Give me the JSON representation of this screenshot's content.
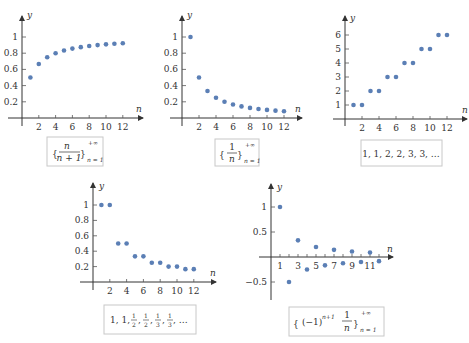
{
  "chart_data": [
    {
      "id": "plot1",
      "type": "scatter",
      "title": "",
      "xlabel": "n",
      "ylabel": "y",
      "caption": "{ n/(n+1) } n=1 to +∞",
      "x": [
        1,
        2,
        3,
        4,
        5,
        6,
        7,
        8,
        9,
        10,
        11,
        12
      ],
      "values": [
        0.5,
        0.667,
        0.75,
        0.8,
        0.833,
        0.857,
        0.875,
        0.889,
        0.9,
        0.909,
        0.917,
        0.923
      ],
      "xticks": [
        "2",
        "4",
        "6",
        "8",
        "10",
        "12"
      ],
      "yticks": [
        "0.2",
        "0.4",
        "0.6",
        "0.8",
        "1"
      ],
      "xlim": [
        0,
        14
      ],
      "ylim": [
        0,
        1.2
      ],
      "grid": false,
      "legend": false
    },
    {
      "id": "plot2",
      "type": "scatter",
      "title": "",
      "xlabel": "n",
      "ylabel": "y",
      "caption": "{ 1/n } n=1 to +∞",
      "x": [
        1,
        2,
        3,
        4,
        5,
        6,
        7,
        8,
        9,
        10,
        11,
        12
      ],
      "values": [
        1,
        0.5,
        0.333,
        0.25,
        0.2,
        0.167,
        0.143,
        0.125,
        0.111,
        0.1,
        0.091,
        0.083
      ],
      "xticks": [
        "2",
        "4",
        "6",
        "8",
        "10",
        "12"
      ],
      "yticks": [
        "0.2",
        "0.4",
        "0.6",
        "0.8",
        "1"
      ],
      "xlim": [
        0,
        14
      ],
      "ylim": [
        0,
        1.2
      ],
      "grid": false,
      "legend": false
    },
    {
      "id": "plot3",
      "type": "scatter",
      "title": "",
      "xlabel": "n",
      "ylabel": "y",
      "caption": "1, 1, 2, 2, 3, 3, ...",
      "x": [
        1,
        2,
        3,
        4,
        5,
        6,
        7,
        8,
        9,
        10,
        11,
        12
      ],
      "values": [
        1,
        1,
        2,
        2,
        3,
        3,
        4,
        4,
        5,
        5,
        6,
        6
      ],
      "xticks": [
        "2",
        "4",
        "6",
        "8",
        "10",
        "12"
      ],
      "yticks": [
        "1",
        "2",
        "3",
        "4",
        "5",
        "6"
      ],
      "xlim": [
        0,
        14
      ],
      "ylim": [
        0,
        7
      ],
      "grid": false,
      "legend": false
    },
    {
      "id": "plot4",
      "type": "scatter",
      "title": "",
      "xlabel": "n",
      "ylabel": "y",
      "caption": "1, 1, 1/2, 1/2, 1/3, 1/3, ...",
      "x": [
        1,
        2,
        3,
        4,
        5,
        6,
        7,
        8,
        9,
        10,
        11,
        12
      ],
      "values": [
        1,
        1,
        0.5,
        0.5,
        0.333,
        0.333,
        0.25,
        0.25,
        0.2,
        0.2,
        0.167,
        0.167
      ],
      "xticks": [
        "2",
        "4",
        "6",
        "8",
        "10",
        "12"
      ],
      "yticks": [
        "0.2",
        "0.4",
        "0.6",
        "0.8",
        "1"
      ],
      "xlim": [
        0,
        14
      ],
      "ylim": [
        0,
        1.2
      ],
      "grid": false,
      "legend": false
    },
    {
      "id": "plot5",
      "type": "scatter",
      "title": "",
      "xlabel": "n",
      "ylabel": "y",
      "caption": "{ (-1)^(n+1) 1/n } n=1 to +∞",
      "x": [
        1,
        2,
        3,
        4,
        5,
        6,
        7,
        8,
        9,
        10,
        11,
        12
      ],
      "values": [
        1,
        -0.5,
        0.333,
        -0.25,
        0.2,
        -0.167,
        0.143,
        -0.125,
        0.111,
        -0.1,
        0.091,
        -0.083
      ],
      "xticks": [
        "1",
        "3",
        "5",
        "7",
        "9",
        "11"
      ],
      "yticks": [
        "-0.5",
        "0.5",
        "1"
      ],
      "xlim": [
        0,
        14
      ],
      "ylim": [
        -0.8,
        1.3
      ],
      "grid": false,
      "legend": false
    }
  ],
  "labels": {
    "y": "y",
    "n": "n",
    "p1_yticks": [
      "1",
      "0.8",
      "0.6",
      "0.4",
      "0.2"
    ],
    "p1_xticks": [
      "2",
      "4",
      "6",
      "8",
      "10",
      "12"
    ],
    "p3_yticks": [
      "6",
      "5",
      "4",
      "3",
      "2",
      "1"
    ],
    "p5_yticks": [
      "1",
      "0.5",
      "−0.5"
    ],
    "p5_xticks": [
      "1",
      "3",
      "5",
      "7",
      "9",
      "11"
    ],
    "cap1": {
      "num": "n",
      "den": "n + 1",
      "sup": "+∞",
      "sub": "n = 1"
    },
    "cap2": {
      "num": "1",
      "den": "n",
      "sup": "+∞",
      "sub": "n = 1"
    },
    "cap3": "1, 1, 2, 2, 3, 3, …",
    "cap4": {
      "a": "1, 1, ",
      "h1": "1",
      "d1": "2",
      "h2": "1",
      "d2": "2",
      "t1": "1",
      "dt1": "3",
      "t2": "1",
      "dt2": "3",
      "tail": ", …"
    },
    "cap5": {
      "base": "(−1)",
      "exp": "n+1",
      "num": "1",
      "den": "n",
      "sup": "+∞",
      "sub": "n = 1"
    }
  },
  "colors": {
    "dot": "#5b7fb5",
    "axis": "#333333",
    "caption_border": "#c8c8c8"
  }
}
